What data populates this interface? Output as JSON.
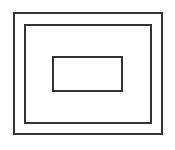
{
  "diagram": {
    "line_color": "#333333",
    "background": "#ffffff",
    "rectangles": [
      {
        "name": "outer",
        "x": 13,
        "y": 12,
        "w": 150,
        "h": 123,
        "stroke": 2
      },
      {
        "name": "middle",
        "x": 24,
        "y": 24,
        "w": 128,
        "h": 100,
        "stroke": 2
      },
      {
        "name": "inner",
        "x": 52,
        "y": 56,
        "w": 71,
        "h": 36,
        "stroke": 2
      }
    ]
  }
}
